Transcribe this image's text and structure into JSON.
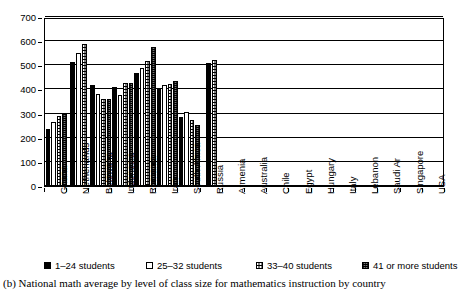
{
  "caption": "(b) National math average by level of class size for mathematics instruction by country",
  "chart_data": {
    "type": "bar",
    "title": "",
    "xlabel": "",
    "ylabel": "",
    "ylim": [
      0,
      700
    ],
    "yticks": [
      0,
      100,
      200,
      300,
      400,
      500,
      600,
      700
    ],
    "grid": true,
    "legend_position": "bottom",
    "categories": [
      "Ghana",
      "Netherlands",
      "Botswana",
      "Indonesia",
      "Romania",
      "Iran",
      "South Africa",
      "Russia",
      "Armenia",
      "Australia",
      "Chile",
      "Egypt",
      "Hungary",
      "Italy",
      "Lebanon",
      "Saudi Ar",
      "Singapore",
      "USA"
    ],
    "series": [
      {
        "name": "1–24 students",
        "swatch": "solid-black",
        "values": [
          235,
          515,
          417,
          410,
          468,
          400,
          287,
          508,
          null,
          null,
          null,
          null,
          null,
          null,
          null,
          null,
          null,
          null
        ]
      },
      {
        "name": "25–32 students",
        "swatch": "white-open",
        "values": [
          265,
          550,
          382,
          375,
          488,
          418,
          305,
          null,
          null,
          null,
          null,
          null,
          null,
          null,
          null,
          null,
          null,
          null
        ]
      },
      {
        "name": "33–40 students",
        "swatch": "white-dotted",
        "values": [
          290,
          588,
          360,
          425,
          518,
          423,
          275,
          520,
          null,
          null,
          null,
          null,
          null,
          null,
          null,
          null,
          null,
          null
        ]
      },
      {
        "name": "41 or more students",
        "swatch": "grey-hatched",
        "values": [
          298,
          null,
          360,
          428,
          575,
          437,
          252,
          null,
          null,
          null,
          null,
          null,
          null,
          null,
          null,
          null,
          null,
          null
        ]
      }
    ]
  }
}
